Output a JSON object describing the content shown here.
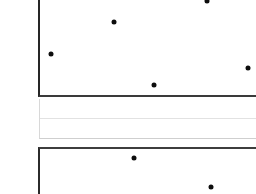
{
  "view": {
    "title": "Panel View",
    "background_color": "#ffffff",
    "width": 256,
    "height": 194
  },
  "panels": [
    {
      "name": "upper-panel",
      "border_color": "#262626",
      "fill_color": "#ffffff",
      "label": ""
    },
    {
      "name": "middle-strip",
      "border_color": "#d8d8d8",
      "fill_color": "#ffffff",
      "label": ""
    },
    {
      "name": "lower-panel",
      "border_color": "#2b2b2b",
      "fill_color": "#ffffff",
      "label": ""
    }
  ],
  "markers": {
    "color": "#0d0d0d",
    "radius_px": 2.5,
    "points": [
      {
        "name": "marker-1",
        "x": 207,
        "y": 1,
        "panel": "upper-panel"
      },
      {
        "name": "marker-2",
        "x": 114,
        "y": 22,
        "panel": "upper-panel"
      },
      {
        "name": "marker-3",
        "x": 51,
        "y": 54,
        "panel": "upper-panel"
      },
      {
        "name": "marker-4",
        "x": 248,
        "y": 68,
        "panel": "upper-panel"
      },
      {
        "name": "marker-5",
        "x": 154,
        "y": 85,
        "panel": "upper-panel"
      },
      {
        "name": "marker-6",
        "x": 134,
        "y": 158,
        "panel": "lower-panel"
      },
      {
        "name": "marker-7",
        "x": 211,
        "y": 187,
        "panel": "lower-panel"
      }
    ]
  }
}
